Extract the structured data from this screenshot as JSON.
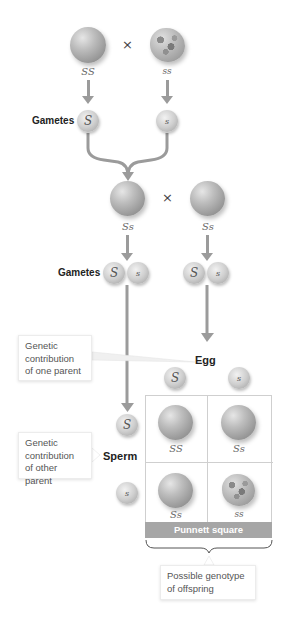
{
  "parents_p": {
    "left": {
      "genotype": "SS",
      "phenotype": "round"
    },
    "right": {
      "genotype": "ss",
      "phenotype": "wrinkled"
    },
    "cross_symbol": "×"
  },
  "gametes_p": {
    "label": "Gametes",
    "left": "S",
    "right": "s"
  },
  "parents_f1": {
    "left": {
      "genotype": "Ss",
      "phenotype": "round"
    },
    "right": {
      "genotype": "Ss",
      "phenotype": "round"
    },
    "cross_symbol": "×"
  },
  "gametes_f1": {
    "label": "Gametes",
    "left": [
      "S",
      "s"
    ],
    "right": [
      "S",
      "s"
    ]
  },
  "callouts": {
    "one_parent": [
      "Genetic",
      "contribution",
      "of one parent"
    ],
    "other_parent": [
      "Genetic",
      "contribution",
      "of other parent"
    ],
    "offspring": [
      "Possible genotype",
      "of offspring"
    ]
  },
  "egg": {
    "label": "Egg",
    "alleles": [
      "S",
      "s"
    ]
  },
  "sperm": {
    "label": "Sperm",
    "alleles": [
      "S",
      "s"
    ]
  },
  "punnett": {
    "label": "Punnett square",
    "cells": [
      {
        "genotype": "SS",
        "phenotype": "round"
      },
      {
        "genotype": "Ss",
        "phenotype": "round"
      },
      {
        "genotype": "Ss",
        "phenotype": "round"
      },
      {
        "genotype": "ss",
        "phenotype": "wrinkled"
      }
    ]
  },
  "colors": {
    "arrow": "#9b9b9b",
    "band": "#a6a6a6",
    "text": "#222222"
  }
}
